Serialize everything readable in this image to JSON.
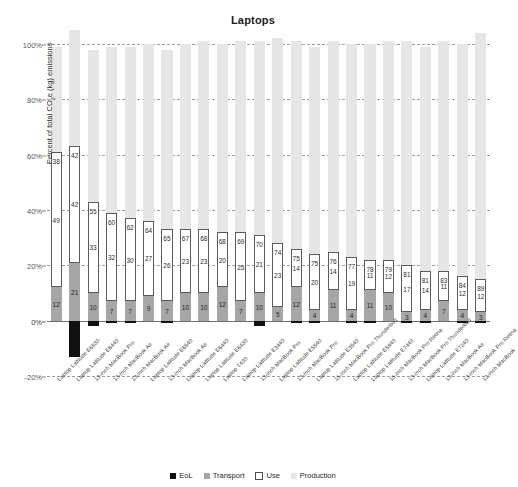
{
  "chart_data": {
    "type": "bar",
    "subtype": "stacked-bar",
    "title": "Laptops",
    "xlabel": "",
    "ylabel": "Percent of total CO₂e (kg) emissions",
    "ylim": [
      -20,
      100
    ],
    "yticks": [
      -20,
      0,
      20,
      40,
      60,
      80,
      100
    ],
    "ytick_labels": [
      "-20%",
      "0%",
      "20%",
      "40%",
      "60%",
      "80%",
      "100%"
    ],
    "grid": true,
    "legend_position": "bottom",
    "legend": [
      "EoL",
      "Transport",
      "Use",
      "Production"
    ],
    "series_colors": {
      "EoL": "#111111",
      "Transport": "#a6a6a6",
      "Use": "#ffffff",
      "Production": "#e6e6e6"
    },
    "categories": [
      "Laptop Latitude E6530",
      "Laptop Latitude E6440",
      "13-inch MacBook Pro",
      "13-inch MacBook Air",
      "13-inch MacBook Air",
      "Laptop Latitude E6540",
      "13-inch MacBook Air",
      "Laptop Latitude E6440",
      "Laptop Latitude E6430",
      "Laptop T430",
      "Laptop Latitude E3440",
      "13-inch MacBook Pro",
      "Laptop Latitude E5540",
      "13-inch MacBook Pro",
      "Laptop Latitude E3540",
      "15-inch MacBook Pro Thunderbolt",
      "Laptop Latitude E5440",
      "Laptop Latitude E7440",
      "15-inch MacBook Pro Retina",
      "13-inch MacBook Pro Thunderbolt",
      "Laptop Latitude E7240",
      "13-inch MacBook Air",
      "13-inch MacBook Pro Retina",
      "12-inch MacBook"
    ],
    "series": [
      {
        "name": "EoL",
        "values": [
          0,
          -13,
          -2,
          -1,
          -1,
          0,
          -1,
          0,
          0,
          0,
          0,
          -2,
          0,
          -1,
          -1,
          0,
          -1,
          -1,
          0,
          -1,
          -1,
          0,
          -1,
          -1
        ]
      },
      {
        "name": "Transport",
        "values": [
          12,
          21,
          10,
          7,
          7,
          9,
          7,
          10,
          10,
          12,
          7,
          10,
          5,
          12,
          4,
          11,
          4,
          11,
          10,
          3,
          4,
          7,
          4,
          3
        ]
      },
      {
        "name": "Use",
        "values": [
          49,
          42,
          33,
          32,
          30,
          27,
          26,
          23,
          23,
          20,
          25,
          21,
          23,
          14,
          20,
          14,
          19,
          11,
          12,
          17,
          14,
          11,
          12,
          12
        ]
      },
      {
        "name": "Production",
        "values": [
          38,
          42,
          55,
          60,
          62,
          64,
          65,
          67,
          68,
          68,
          69,
          70,
          74,
          75,
          75,
          76,
          77,
          78,
          79,
          81,
          81,
          83,
          84,
          89
        ]
      }
    ],
    "bar_labels": {
      "production": [
        38,
        42,
        55,
        60,
        62,
        64,
        65,
        67,
        68,
        68,
        69,
        70,
        74,
        75,
        75,
        76,
        77,
        78,
        79,
        81,
        81,
        83,
        84,
        89
      ],
      "use": [
        49,
        42,
        33,
        32,
        30,
        27,
        26,
        23,
        23,
        20,
        25,
        21,
        23,
        14,
        20,
        14,
        19,
        11,
        12,
        17,
        14,
        11,
        12,
        12
      ],
      "transport": [
        12,
        21,
        10,
        7,
        7,
        9,
        7,
        10,
        10,
        12,
        7,
        10,
        5,
        12,
        4,
        11,
        4,
        11,
        10,
        3,
        4,
        7,
        4,
        3
      ]
    }
  }
}
